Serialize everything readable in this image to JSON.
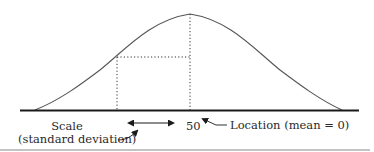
{
  "diagram": {
    "type": "normal-distribution-curve",
    "colors": {
      "curve": "#555555",
      "baseline": "#1a1a1a",
      "dotted": "#333333",
      "text": "#2a2a2a",
      "rule": "#888888"
    },
    "labels": {
      "center_value": "50",
      "location": "Location (mean = 0)",
      "scale_line1": "Scale",
      "scale_line2": "(standard deviation)"
    },
    "icons": {
      "scale_arrow": "double-headed-arrow",
      "location_pointer": "arrow-pointing-left",
      "scale_pointer": "curved-arrow-pointing-up-right"
    }
  }
}
